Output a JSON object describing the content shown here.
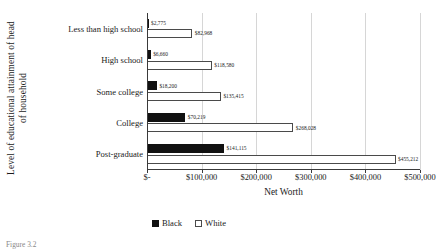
{
  "figure": {
    "caption": "Figure 3.2"
  },
  "legend": {
    "position": "bottom-left",
    "items": [
      {
        "label": "Black",
        "swatch": "filled-black-square"
      },
      {
        "label": "White",
        "swatch": "outlined-white-square"
      }
    ]
  },
  "chart_data": {
    "type": "bar",
    "orientation": "horizontal",
    "title": "",
    "xlabel": "Net Worth",
    "ylabel": "Level of educational attainment of head of household",
    "ylabel_lines": [
      "Level of educational attainment of head",
      "of household"
    ],
    "categories": [
      "Less than high school",
      "High school",
      "Some college",
      "College",
      "Post-graduate"
    ],
    "series": [
      {
        "name": "Black",
        "color": "#111111",
        "values": [
          2775,
          6660,
          18200,
          70219,
          141115
        ],
        "labels": [
          "$2,775",
          "$6,660",
          "$18,200",
          "$70,219",
          "$141,115"
        ]
      },
      {
        "name": "White",
        "color": "#ffffff",
        "values": [
          82968,
          118580,
          135415,
          268028,
          455212
        ],
        "labels": [
          "$82,968",
          "$118,580",
          "$135,415",
          "$268,028",
          "$455,212"
        ]
      }
    ],
    "xlim": [
      0,
      500000
    ],
    "xticks": [
      0,
      100000,
      200000,
      300000,
      400000,
      500000
    ],
    "xtick_labels": [
      "$-",
      "$100,000",
      "$200,000",
      "$300,000",
      "$400,000",
      "$500,000"
    ],
    "grid": "vertical"
  }
}
